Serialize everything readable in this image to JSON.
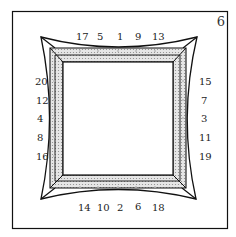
{
  "figure_number": "6",
  "labels": {
    "top": [
      "17",
      "5",
      "1",
      "9",
      "13"
    ],
    "bottom": [
      "14",
      "10",
      "2",
      "6",
      "18"
    ],
    "left": [
      "20",
      "12",
      "4",
      "8",
      "16"
    ],
    "right": [
      "15",
      "7",
      "3",
      "11",
      "19"
    ]
  },
  "colors": {
    "line": "#111111",
    "fill": "#d9d9d9",
    "dot": "#bbbbbb"
  }
}
